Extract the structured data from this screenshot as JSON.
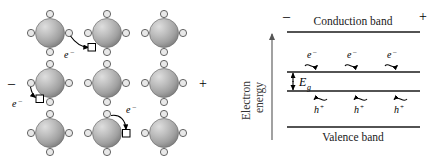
{
  "figure": {
    "panels": [
      "lattice",
      "band-diagram"
    ]
  },
  "lattice": {
    "label": "Atomic lattice with electron hopping",
    "negative_terminal": "–",
    "positive_terminal": "+",
    "electron_label": "e",
    "electron_charge_sup": "–",
    "atom_count": 9,
    "rows": 3,
    "columns": 3,
    "atoms": [
      {
        "id": "atom-r1c1",
        "cx": 50,
        "cy": 33
      },
      {
        "id": "atom-r1c2",
        "cx": 107,
        "cy": 33
      },
      {
        "id": "atom-r1c3",
        "cx": 164,
        "cy": 33
      },
      {
        "id": "atom-r2c1",
        "cx": 50,
        "cy": 83
      },
      {
        "id": "atom-r2c2",
        "cx": 107,
        "cy": 83
      },
      {
        "id": "atom-r2c3",
        "cx": 164,
        "cy": 83
      },
      {
        "id": "atom-r3c1",
        "cx": 50,
        "cy": 133
      },
      {
        "id": "atom-r3c2",
        "cx": 107,
        "cy": 133
      },
      {
        "id": "atom-r3c3",
        "cx": 164,
        "cy": 133
      }
    ],
    "holes": [
      {
        "id": "hole-1",
        "x": 92,
        "y": 47
      },
      {
        "id": "hole-2",
        "x": 35,
        "y": 97
      },
      {
        "id": "hole-3",
        "x": 149,
        "y": 133
      }
    ],
    "hops": [
      {
        "id": "hop-1",
        "from": "atom-r1c1-east",
        "to": "hole-1",
        "label_x": 70,
        "label_y": 55
      },
      {
        "id": "hop-2",
        "from": "atom-r2c1-west",
        "to": "hole-2",
        "label_x": 15,
        "label_y": 105
      },
      {
        "id": "hop-3",
        "from": "atom-r3c2-north",
        "to": "hole-3",
        "label_x": 129,
        "label_y": 108
      }
    ]
  },
  "band_diagram": {
    "label": "Electron energy band diagram",
    "axis_label_line1": "Electron",
    "axis_label_line2": "energy",
    "conduction_band_label": "Conduction band",
    "valence_band_label": "Valence band",
    "band_gap_label": "E",
    "band_gap_subscript": "g",
    "negative_terminal": "–",
    "positive_terminal": "+",
    "electron_label": "e",
    "electron_charge_sup": "–",
    "hole_label": "h",
    "hole_charge_sup": "+",
    "electron_count": 3,
    "hole_count": 3,
    "electron_drift_direction": "right",
    "hole_drift_direction": "left",
    "band_lines": [
      {
        "id": "conduction-band-top-line",
        "y": 32
      },
      {
        "id": "conduction-band-bottom-line",
        "y": 72
      },
      {
        "id": "valence-band-top-line",
        "y": 91
      },
      {
        "id": "valence-band-bottom-line",
        "y": 127
      }
    ],
    "line_x_start": 287,
    "line_x_end": 420,
    "carriers_electrons": [
      {
        "id": "electron-1",
        "x": 312
      },
      {
        "id": "electron-2",
        "x": 352
      },
      {
        "id": "electron-3",
        "x": 392
      }
    ],
    "carriers_holes": [
      {
        "id": "hole-1",
        "x": 320
      },
      {
        "id": "hole-2",
        "x": 360
      },
      {
        "id": "hole-3",
        "x": 400
      }
    ]
  },
  "colors": {
    "ink": "#000000",
    "band_line": "#1a1a1a",
    "axis": "#555555",
    "atom_fill_light": "#d8d8d8",
    "atom_fill_mid": "#a8a8a8",
    "atom_fill_dark": "#7a7a7a",
    "valence_electron_fill": "#e8e8e8",
    "hole_fill": "#ffffff",
    "background": "#ffffff"
  }
}
